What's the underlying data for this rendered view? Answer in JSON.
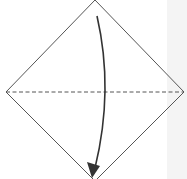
{
  "diagram": {
    "type": "origami-fold-step",
    "shape": "square-on-point",
    "fold_line": "dashed-horizontal-diagonal",
    "arrow": "fold-top-to-bottom",
    "colors": {
      "outline": "#555555",
      "dash": "#555555",
      "arrow": "#333333",
      "background": "#ffffff",
      "side_strip": "#f4f4f4"
    }
  }
}
